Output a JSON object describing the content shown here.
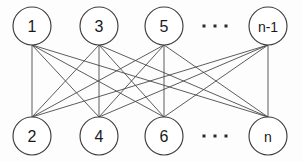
{
  "figure": {
    "kind": "bipartite-graph-diagram",
    "background_color": "#fdfdfd",
    "node_fill": "#ffffff",
    "node_stroke": "#3d3d3d",
    "edge_color": "#4a4a4a",
    "label_color": "#1a1a1a",
    "width": 302,
    "height": 162
  },
  "nodes": {
    "top": [
      {
        "id": "n1",
        "label": "1",
        "cx": 32,
        "cy": 26,
        "r": 19,
        "label_class": "node-label-num"
      },
      {
        "id": "n3",
        "label": "3",
        "cx": 99,
        "cy": 26,
        "r": 19,
        "label_class": "node-label-num"
      },
      {
        "id": "n5",
        "label": "5",
        "cx": 164,
        "cy": 26,
        "r": 19,
        "label_class": "node-label-num"
      },
      {
        "id": "nm1",
        "label": "n-1",
        "cx": 268,
        "cy": 26,
        "r": 19,
        "label_class": "node-label-sym"
      }
    ],
    "bottom": [
      {
        "id": "n2",
        "label": "2",
        "cx": 32,
        "cy": 136,
        "r": 19,
        "label_class": "node-label-num"
      },
      {
        "id": "n4",
        "label": "4",
        "cx": 99,
        "cy": 136,
        "r": 19,
        "label_class": "node-label-num"
      },
      {
        "id": "n6",
        "label": "6",
        "cx": 164,
        "cy": 136,
        "r": 19,
        "label_class": "node-label-num"
      },
      {
        "id": "nn",
        "label": "n",
        "cx": 268,
        "cy": 136,
        "r": 19,
        "label_class": "node-label-sym"
      }
    ]
  },
  "ellipses": [
    {
      "id": "top-ellipsis",
      "cx": 215,
      "cy": 26,
      "dots": 3,
      "dot_size": 3,
      "gap": 11
    },
    {
      "id": "bottom-ellipsis",
      "cx": 215,
      "cy": 136,
      "dots": 3,
      "dot_size": 3,
      "gap": 11
    }
  ],
  "edges": [
    {
      "from": "n1",
      "to": "n2"
    },
    {
      "from": "n1",
      "to": "n4"
    },
    {
      "from": "n1",
      "to": "n6"
    },
    {
      "from": "n1",
      "to": "nn"
    },
    {
      "from": "n3",
      "to": "n2"
    },
    {
      "from": "n3",
      "to": "n4"
    },
    {
      "from": "n3",
      "to": "n6"
    },
    {
      "from": "n3",
      "to": "nn"
    },
    {
      "from": "n5",
      "to": "n2"
    },
    {
      "from": "n5",
      "to": "n4"
    },
    {
      "from": "n5",
      "to": "n6"
    },
    {
      "from": "n5",
      "to": "nn"
    },
    {
      "from": "nm1",
      "to": "n2"
    },
    {
      "from": "nm1",
      "to": "n4"
    },
    {
      "from": "nm1",
      "to": "n6"
    },
    {
      "from": "nm1",
      "to": "nn"
    }
  ]
}
